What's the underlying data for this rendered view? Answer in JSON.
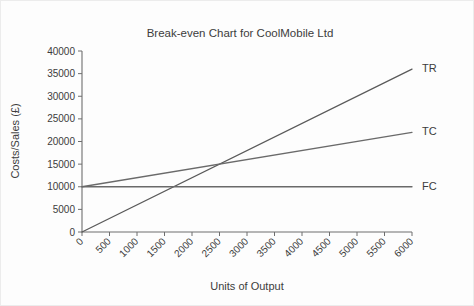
{
  "chart_data": {
    "type": "line",
    "title": "Break-even Chart for CoolMobile Ltd",
    "xlabel": "Units of Output",
    "ylabel": "Costs/Sales (£)",
    "xlim": [
      0,
      6000
    ],
    "ylim": [
      0,
      40000
    ],
    "grid": false,
    "legend_position": "right-of-line-ends",
    "x_ticks": [
      "0",
      "500",
      "1000",
      "1500",
      "2000",
      "2500",
      "3000",
      "3500",
      "4000",
      "4500",
      "5000",
      "5500",
      "6000"
    ],
    "x_tick_values": [
      0,
      500,
      1000,
      1500,
      2000,
      2500,
      3000,
      3500,
      4000,
      4500,
      5000,
      5500,
      6000
    ],
    "y_ticks": [
      "0",
      "5000",
      "10000",
      "15000",
      "20000",
      "25000",
      "30000",
      "35000",
      "40000"
    ],
    "y_tick_values": [
      0,
      5000,
      10000,
      15000,
      20000,
      25000,
      30000,
      35000,
      40000
    ],
    "x": [
      0,
      6000
    ],
    "series": [
      {
        "name": "TR",
        "label": "TR",
        "description": "Total Revenue",
        "values": [
          0,
          36000
        ],
        "color": "#5a5a5a"
      },
      {
        "name": "TC",
        "label": "TC",
        "description": "Total Costs",
        "values": [
          10000,
          22000
        ],
        "color": "#6a6a6a"
      },
      {
        "name": "FC",
        "label": "FC",
        "description": "Fixed Costs",
        "values": [
          10000,
          10000
        ],
        "color": "#6a6a6a"
      }
    ],
    "annotations": {
      "break_even_units": 2500,
      "break_even_value": 15000
    }
  },
  "colors": {
    "axis": "#6e6e6e",
    "text": "#3c3c3c",
    "background": "#fdfdfd",
    "border": "#ececec"
  }
}
